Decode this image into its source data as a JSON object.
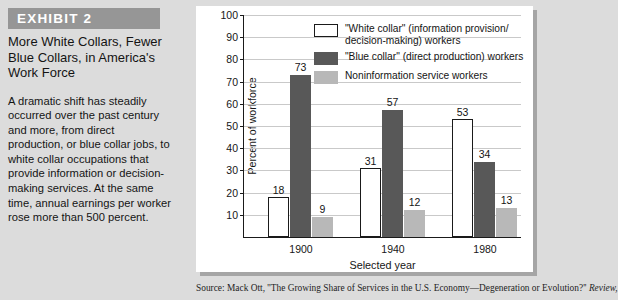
{
  "exhibit": {
    "banner_label": "EXHIBIT 2",
    "title": "More White Collars, Fewer Blue Collars, in America's Work Force",
    "body": "A dramatic shift has steadily occurred over the past century and more, from direct production, or blue collar jobs, to white collar occupations that provide information or decision-making services. At the same time, annual earnings per worker rose more than 500 percent."
  },
  "legend": {
    "items": [
      {
        "swatch": "white-collar",
        "label": "\"White collar\" (information provision/ decision-making) workers"
      },
      {
        "swatch": "blue-collar",
        "label": "\"Blue collar\" (direct production) workers"
      },
      {
        "swatch": "noninfo",
        "label": "Noninformation service workers"
      }
    ]
  },
  "source": {
    "prefix": "Source: Mack Ott, ''The Growing Share of Services in the U.S. Economy—Degeneration or Evolution?'' ",
    "italic": "Review,"
  },
  "chart_data": {
    "type": "bar",
    "title": "",
    "xlabel": "Selected year",
    "ylabel": "Percent of workforce",
    "categories": [
      "1900",
      "1940",
      "1980"
    ],
    "series": [
      {
        "name": "\"White collar\" (information provision/decision-making) workers",
        "color": "#ffffff",
        "values": [
          18,
          31,
          53
        ]
      },
      {
        "name": "\"Blue collar\" (direct production) workers",
        "color": "#585858",
        "values": [
          73,
          57,
          34
        ]
      },
      {
        "name": "Noninformation service workers",
        "color": "#b8b8b8",
        "values": [
          9,
          12,
          13
        ]
      }
    ],
    "ylim": [
      0,
      100
    ],
    "yticks": [
      10,
      20,
      30,
      40,
      50,
      60,
      70,
      80,
      90,
      100
    ],
    "grid": true,
    "legend_position": "top-right"
  }
}
